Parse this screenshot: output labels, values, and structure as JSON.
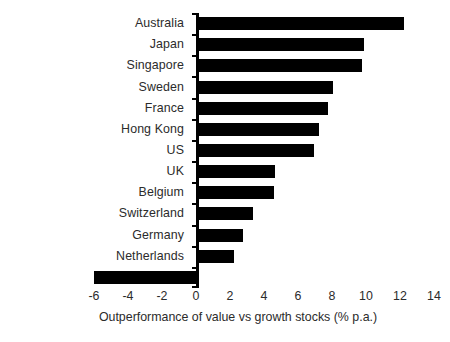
{
  "chart_data": {
    "type": "bar",
    "orientation": "horizontal",
    "title": "",
    "xlabel": "Outperformance of value vs growth stocks (% p.a.)",
    "ylabel": "",
    "categories": [
      "Australia",
      "Japan",
      "Singapore",
      "Sweden",
      "France",
      "Hong Kong",
      "US",
      "UK",
      "Belgium",
      "Switzerland",
      "Germany",
      "Netherlands",
      "Italy"
    ],
    "values": [
      12.2,
      9.8,
      9.7,
      8.0,
      7.7,
      7.2,
      6.9,
      4.6,
      4.5,
      3.3,
      2.7,
      2.2,
      -6.0
    ],
    "xlim": [
      -6,
      14
    ],
    "xticks": [
      -6,
      -4,
      -2,
      0,
      2,
      4,
      6,
      8,
      10,
      12,
      14
    ],
    "xtick_labels": [
      "-6",
      "-4",
      "-2",
      "0",
      "2",
      "4",
      "6",
      "8",
      "10",
      "12",
      "14"
    ],
    "grid": false,
    "legend": null,
    "bar_color": "#000000",
    "axis_color": "#000000",
    "text_color": "#2b2b2b",
    "background": "#ffffff"
  }
}
